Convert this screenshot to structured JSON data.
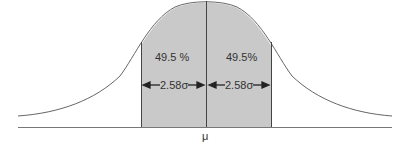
{
  "diagram": {
    "type": "normal-distribution",
    "labels": {
      "left_percent": "49.5 %",
      "right_percent": "49.5%",
      "left_width": "2.58σ",
      "right_width": "2.58σ",
      "mean": "μ"
    },
    "colors": {
      "shade": "#c8c8c8",
      "line": "#555555",
      "curve": "#666666"
    }
  }
}
